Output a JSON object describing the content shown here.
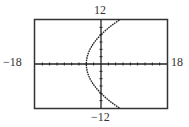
{
  "chart_data": {
    "type": "line",
    "title": "",
    "xlabel": "",
    "ylabel": "",
    "xlim": [
      -18,
      18
    ],
    "ylim": [
      -12,
      12
    ],
    "x_tick_spacing": 2,
    "y_tick_spacing": 2,
    "grid": false,
    "tick_labels": {
      "xmin": "−18",
      "xmax": "18",
      "ymin": "−12",
      "ymax": "12"
    },
    "series": [
      {
        "name": "parabola opening right (x = y²/16 − 4)",
        "points": [
          {
            "x": 5,
            "y": -12
          },
          {
            "x": 2.25,
            "y": -10
          },
          {
            "x": 0,
            "y": -8
          },
          {
            "x": -1.75,
            "y": -6
          },
          {
            "x": -3,
            "y": -4
          },
          {
            "x": -3.75,
            "y": -2
          },
          {
            "x": -4,
            "y": 0
          },
          {
            "x": -3.75,
            "y": 2
          },
          {
            "x": -3,
            "y": 4
          },
          {
            "x": -1.75,
            "y": 6
          },
          {
            "x": 0,
            "y": 8
          },
          {
            "x": 2.25,
            "y": 10
          },
          {
            "x": 5,
            "y": 12
          }
        ]
      }
    ]
  }
}
